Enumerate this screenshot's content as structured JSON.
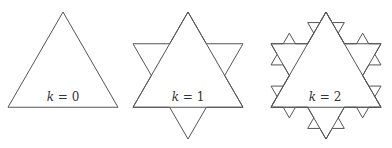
{
  "figure": {
    "stroke_color": "#555555",
    "panels": [
      {
        "iteration": 0,
        "label_var": "k",
        "label_eq": " = ",
        "label_val": "0"
      },
      {
        "iteration": 1,
        "label_var": "k",
        "label_eq": " = ",
        "label_val": "1"
      },
      {
        "iteration": 2,
        "label_var": "k",
        "label_eq": " = ",
        "label_val": "2"
      }
    ]
  }
}
